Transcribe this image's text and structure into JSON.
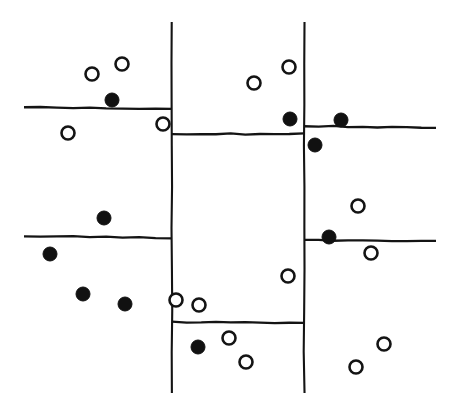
{
  "figure": {
    "width": 458,
    "height": 409,
    "background_color": "#ffffff",
    "ink_color": "#141414",
    "style": "hand-drawn line diagram"
  },
  "chart_data": {
    "type": "scatter",
    "title": "",
    "subtitle": "",
    "xlabel": "",
    "ylabel": "",
    "xlim": [
      0,
      458
    ],
    "ylim": [
      0,
      409
    ],
    "grid": false,
    "axes_visible": false,
    "tick_labels_x": [],
    "tick_labels_y": [],
    "legend": {
      "visible": false,
      "position": "none",
      "entries": [
        {
          "name": "filled",
          "marker": "filled-circle",
          "color": "#111111"
        },
        {
          "name": "open",
          "marker": "open-circle",
          "color": "#ffffff"
        }
      ]
    },
    "annotations": [],
    "series": [
      {
        "name": "filled",
        "marker": "filled-circle",
        "color": "#111111",
        "radius": 7,
        "count": 10,
        "points": [
          {
            "x": 112,
            "y": 100
          },
          {
            "x": 290,
            "y": 119
          },
          {
            "x": 341,
            "y": 120
          },
          {
            "x": 315,
            "y": 145
          },
          {
            "x": 104,
            "y": 218
          },
          {
            "x": 329,
            "y": 237
          },
          {
            "x": 50,
            "y": 254
          },
          {
            "x": 83,
            "y": 294
          },
          {
            "x": 125,
            "y": 304
          },
          {
            "x": 198,
            "y": 347
          }
        ]
      },
      {
        "name": "open",
        "marker": "open-circle",
        "color": "#ffffff",
        "radius": 6.5,
        "count": 16,
        "points": [
          {
            "x": 122,
            "y": 64
          },
          {
            "x": 92,
            "y": 74
          },
          {
            "x": 289,
            "y": 67
          },
          {
            "x": 254,
            "y": 83
          },
          {
            "x": 163,
            "y": 124
          },
          {
            "x": 68,
            "y": 133
          },
          {
            "x": 358,
            "y": 206
          },
          {
            "x": 371,
            "y": 253
          },
          {
            "x": 288,
            "y": 276
          },
          {
            "x": 176,
            "y": 300
          },
          {
            "x": 199,
            "y": 305
          },
          {
            "x": 229,
            "y": 338
          },
          {
            "x": 246,
            "y": 362
          },
          {
            "x": 384,
            "y": 344
          },
          {
            "x": 356,
            "y": 367
          },
          {
            "x": 246,
            "y": 362
          }
        ]
      }
    ],
    "partition_lines": [
      {
        "id": "vertical-left",
        "orientation": "vertical",
        "x1": 172,
        "y1": 22,
        "x2": 172,
        "y2": 393
      },
      {
        "id": "vertical-right",
        "orientation": "vertical",
        "x1": 304,
        "y1": 22,
        "x2": 304,
        "y2": 393
      },
      {
        "id": "horizontal-upper-left",
        "orientation": "horizontal",
        "x1": 24,
        "y1": 107,
        "x2": 172,
        "y2": 109
      },
      {
        "id": "horizontal-middle-top",
        "orientation": "horizontal",
        "x1": 172,
        "y1": 134,
        "x2": 304,
        "y2": 134
      },
      {
        "id": "horizontal-upper-right",
        "orientation": "horizontal",
        "x1": 304,
        "y1": 126,
        "x2": 436,
        "y2": 128
      },
      {
        "id": "horizontal-lower-left",
        "orientation": "horizontal",
        "x1": 24,
        "y1": 236,
        "x2": 172,
        "y2": 238
      },
      {
        "id": "horizontal-lower-right",
        "orientation": "horizontal",
        "x1": 304,
        "y1": 240,
        "x2": 436,
        "y2": 241
      },
      {
        "id": "horizontal-middle-bottom",
        "orientation": "horizontal",
        "x1": 172,
        "y1": 322,
        "x2": 304,
        "y2": 323
      }
    ]
  }
}
